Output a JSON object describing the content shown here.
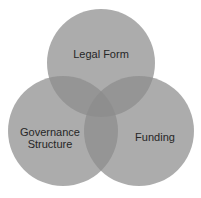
{
  "diagram": {
    "type": "venn",
    "circles": [
      {
        "id": "legal-form",
        "label": "Legal Form",
        "cx": 101,
        "cy": 63,
        "r": 54
      },
      {
        "id": "governance-structure",
        "label_line1": "Governance",
        "label_line2": "Structure",
        "cx": 63,
        "cy": 131,
        "r": 55
      },
      {
        "id": "funding",
        "label": "Funding",
        "cx": 139,
        "cy": 131,
        "r": 55
      }
    ],
    "colors": {
      "circle_fill": "#8c8c8c",
      "circle_opacity": "0.72",
      "background": "#ffffff",
      "text": "#262626"
    }
  }
}
